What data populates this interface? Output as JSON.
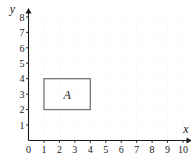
{
  "chart_data": {
    "type": "scatter",
    "title": "",
    "xlabel": "x",
    "ylabel": "y",
    "xlim": [
      0,
      10
    ],
    "ylim": [
      0,
      8
    ],
    "grid": true,
    "legend": null,
    "x_ticks": [
      "0",
      "1",
      "2",
      "3",
      "4",
      "5",
      "6",
      "7",
      "8",
      "9",
      "10"
    ],
    "y_ticks": [
      "1",
      "2",
      "3",
      "4",
      "5",
      "6",
      "7",
      "8"
    ],
    "x_tick_values": [
      0,
      1,
      2,
      3,
      4,
      5,
      6,
      7,
      8,
      9,
      10
    ],
    "y_tick_values": [
      1,
      2,
      3,
      4,
      5,
      6,
      7,
      8
    ],
    "annotations": [
      {
        "label": "A",
        "shape": "rectangle",
        "x_min": 1,
        "x_max": 4,
        "y_min": 2,
        "y_max": 4,
        "vertices": [
          [
            1,
            2
          ],
          [
            4,
            2
          ],
          [
            4,
            4
          ],
          [
            1,
            4
          ]
        ],
        "stroke": "#767676",
        "fill": "none"
      }
    ],
    "series": []
  },
  "axes": {
    "x_axis_name": "x",
    "y_axis_name": "y",
    "origin_label": "0",
    "y_top_label": "8"
  },
  "colors": {
    "background": "#ffffff",
    "axis": "#1a1a1a",
    "grid": "#fafafa",
    "shape_stroke": "#767676",
    "text": "#1a1a1a"
  }
}
